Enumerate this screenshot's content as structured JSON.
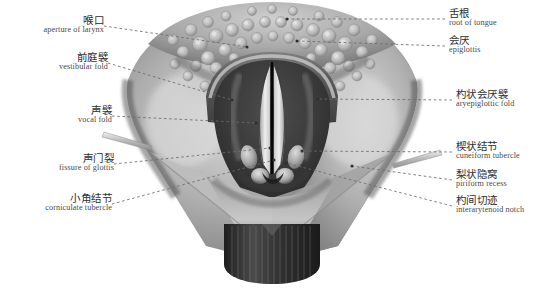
{
  "figure": {
    "background_color": "#ffffff",
    "leader_line_color": "#6b6b6b",
    "label_cn_color": "#2e2e2e",
    "label_en_color": "#4a4a4a"
  },
  "labels_left": [
    {
      "id": "aperture-of-larynx",
      "cn": "喉口",
      "en": "aperture of larynx",
      "cn_x": 100,
      "cn_y": 20,
      "en_x": 100,
      "en_y": 31,
      "leader_from_x": 104,
      "leader_from_y": 26,
      "leader_to_x": 247,
      "leader_to_y": 47
    },
    {
      "id": "vestibular-fold",
      "cn": "前庭襞",
      "en": "vestibular fold",
      "cn_x": 104,
      "cn_y": 57,
      "en_x": 104,
      "en_y": 68,
      "leader_from_x": 108,
      "leader_from_y": 63,
      "leader_to_x": 232,
      "leader_to_y": 100
    },
    {
      "id": "vocal-fold",
      "cn": "声襞",
      "en": "vocal fold",
      "cn_x": 108,
      "cn_y": 110,
      "en_x": 108,
      "en_y": 121,
      "leader_from_x": 112,
      "leader_from_y": 116,
      "leader_to_x": 256,
      "leader_to_y": 123
    },
    {
      "id": "fissure-of-glottis",
      "cn": "声门裂",
      "en": "fissure of glottis",
      "cn_x": 110,
      "cn_y": 158,
      "en_x": 110,
      "en_y": 169,
      "leader_from_x": 114,
      "leader_from_y": 164,
      "leader_to_x": 270,
      "leader_to_y": 148
    },
    {
      "id": "corniculate-tubercle",
      "cn": "小角结节",
      "en": "corniculate tubercle",
      "cn_x": 108,
      "cn_y": 198,
      "en_x": 108,
      "en_y": 209,
      "leader_from_x": 112,
      "leader_from_y": 204,
      "leader_to_x": 274,
      "leader_to_y": 160
    }
  ],
  "labels_right": [
    {
      "id": "root-of-tongue",
      "cn": "舌根",
      "en": "root of tongue",
      "cn_x": 449,
      "cn_y": 13,
      "en_x": 449,
      "en_y": 24,
      "leader_from_x": 445,
      "leader_from_y": 19,
      "leader_to_x": 287,
      "leader_to_y": 19
    },
    {
      "id": "epiglottis",
      "cn": "会厌",
      "en": "epiglottis",
      "cn_x": 449,
      "cn_y": 40,
      "en_x": 449,
      "en_y": 51,
      "leader_from_x": 445,
      "leader_from_y": 46,
      "leader_to_x": 297,
      "leader_to_y": 41
    },
    {
      "id": "aryepiglottic-fold",
      "cn": "杓状会厌襞",
      "en": "aryepiglottic fold",
      "cn_x": 456,
      "cn_y": 94,
      "en_x": 456,
      "en_y": 105,
      "leader_from_x": 452,
      "leader_from_y": 100,
      "leader_to_x": 318,
      "leader_to_y": 99
    },
    {
      "id": "cuneiform-tubercle",
      "cn": "楔状结节",
      "en": "cuneiform tubercle",
      "cn_x": 456,
      "cn_y": 146,
      "en_x": 456,
      "en_y": 157,
      "leader_from_x": 452,
      "leader_from_y": 152,
      "leader_to_x": 302,
      "leader_to_y": 151
    },
    {
      "id": "piriform-recess",
      "cn": "梨状隐窝",
      "en": "piriform recess",
      "cn_x": 456,
      "cn_y": 174,
      "en_x": 456,
      "en_y": 185,
      "leader_from_x": 452,
      "leader_from_y": 180,
      "leader_to_x": 352,
      "leader_to_y": 166
    },
    {
      "id": "interarytenoid-notch",
      "cn": "杓间切迹",
      "en": "interarytenoid notch",
      "cn_x": 456,
      "cn_y": 200,
      "en_x": 456,
      "en_y": 211,
      "leader_from_x": 452,
      "leader_from_y": 206,
      "leader_to_x": 286,
      "leader_to_y": 163
    }
  ]
}
